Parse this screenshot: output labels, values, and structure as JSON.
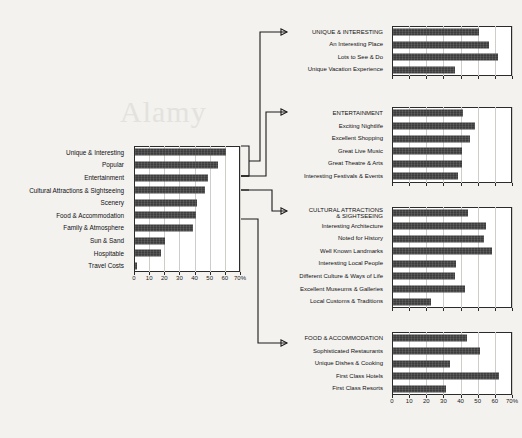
{
  "watermark": "Alamy",
  "chart_data": [
    {
      "id": "main",
      "type": "bar",
      "orientation": "horizontal",
      "title": "",
      "xlabel": "",
      "ylabel": "",
      "xlim": [
        0,
        70
      ],
      "ticks": [
        0,
        10,
        20,
        30,
        40,
        50,
        60,
        70
      ],
      "tick_labels": [
        "0",
        "10",
        "20",
        "30",
        "40",
        "50",
        "60",
        "70%"
      ],
      "grid": true,
      "categories": [
        "Unique & Interesting",
        "Popular",
        "Entertainment",
        "Cultural Attractions & Sightseeing",
        "Scenery",
        "Food & Accommodation",
        "Family & Atmosphere",
        "Sun & Sand",
        "Hospitable",
        "Travel Costs"
      ],
      "values": [
        60,
        55,
        48,
        46,
        41,
        40,
        38,
        20,
        17,
        1
      ]
    },
    {
      "id": "unique",
      "type": "bar",
      "orientation": "horizontal",
      "title": "",
      "xlim": [
        0,
        70
      ],
      "ticks": [
        0,
        10,
        20,
        30,
        40,
        50,
        60,
        70
      ],
      "tick_labels": [
        "",
        "",
        "",
        "",
        "",
        "",
        "",
        ""
      ],
      "grid": true,
      "categories": [
        "UNIQUE & INTERESTING",
        "An Interesting Place",
        "Lots to See & Do",
        "Unique Vacation Experience"
      ],
      "values": [
        50,
        56,
        61,
        36
      ]
    },
    {
      "id": "entertainment",
      "type": "bar",
      "orientation": "horizontal",
      "title": "",
      "xlim": [
        0,
        70
      ],
      "ticks": [
        0,
        10,
        20,
        30,
        40,
        50,
        60,
        70
      ],
      "tick_labels": [
        "",
        "",
        "",
        "",
        "",
        "",
        "",
        ""
      ],
      "grid": true,
      "categories": [
        "ENTERTAINMENT",
        "Exciting Nightlife",
        "Excellent Shopping",
        "Great Live Music",
        "Great Theatre & Arts",
        "Interesting Festivals & Events"
      ],
      "values": [
        41,
        48,
        45,
        40,
        40,
        38
      ]
    },
    {
      "id": "cultural",
      "type": "bar",
      "orientation": "horizontal",
      "title": "",
      "xlim": [
        0,
        70
      ],
      "ticks": [
        0,
        10,
        20,
        30,
        40,
        50,
        60,
        70
      ],
      "tick_labels": [
        "",
        "",
        "",
        "",
        "",
        "",
        "",
        ""
      ],
      "grid": true,
      "categories": [
        "CULTURAL ATTRACTIONS\n& SIGHTSEEING",
        "Interesting Architecture",
        "Noted for History",
        "Well Known Landmarks",
        "Interesting Local People",
        "Different Culture & Ways of Life",
        "Excellent Museums & Galleries",
        "Local Customs & Traditions"
      ],
      "values": [
        44,
        54,
        53,
        58,
        37,
        36,
        42,
        22
      ]
    },
    {
      "id": "food",
      "type": "bar",
      "orientation": "horizontal",
      "title": "",
      "xlim": [
        0,
        70
      ],
      "ticks": [
        0,
        10,
        20,
        30,
        40,
        50,
        60,
        70
      ],
      "tick_labels": [
        "0",
        "10",
        "20",
        "30",
        "40",
        "50",
        "60",
        "70%"
      ],
      "grid": true,
      "categories": [
        "FOOD & ACCOMMODATION",
        "Sophisticated Restaurants",
        "Unique Dishes & Cooking",
        "First Class Hotels",
        "First Class Resorts"
      ],
      "values": [
        43,
        51,
        33,
        62,
        31
      ]
    }
  ]
}
